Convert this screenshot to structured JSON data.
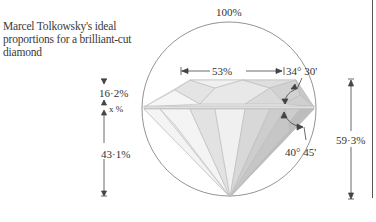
{
  "caption": "Marcel Tolkowsky's ideal proportions for a brilliant-cut diamond",
  "labels": {
    "diameter": "100%",
    "table": "53%",
    "crown_angle": "34° 30'",
    "pavilion_angle": "40° 45'",
    "crown_height": "16·2%",
    "girdle": "x %",
    "pavilion_depth": "43·1%",
    "total_depth": "59·3%"
  },
  "colors": {
    "line": "#555555",
    "facet_light": "#f2f2f2",
    "facet_mid": "#dcdcdc",
    "facet_dark": "#c4c4c4"
  }
}
